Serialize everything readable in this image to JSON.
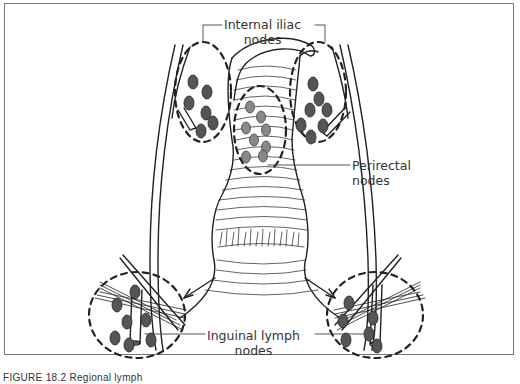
{
  "figure": {
    "caption": "FIGURE 18.2 Regional lymph",
    "labels": {
      "internal_iliac": {
        "line1": "Internal iliac",
        "line2": "nodes"
      },
      "perirectal": {
        "line1": "Perirectal",
        "line2": "nodes"
      },
      "inguinal": {
        "line1": "Inguinal lymph",
        "line2": "nodes"
      }
    },
    "colors": {
      "stroke": "#222222",
      "node_fill": "#555555",
      "frame": "#777777",
      "text": "#333333"
    }
  }
}
